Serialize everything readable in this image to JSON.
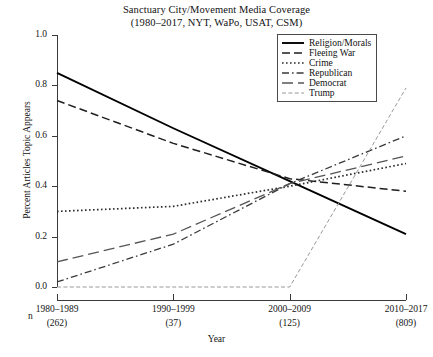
{
  "chart_data": {
    "type": "line",
    "title": "Sanctuary City/Movement Media Coverage",
    "subtitle": "(1980–2017, NYT, WaPo, USAT, CSM)",
    "xlabel": "Year",
    "ylabel": "Percent Articles Topic Appears",
    "ylim": [
      0.0,
      1.0
    ],
    "yticks": [
      "1.0",
      "0.8",
      "0.6",
      "0.4",
      "0.2",
      "0.0"
    ],
    "ytick_values": [
      1.0,
      0.8,
      0.6,
      0.4,
      0.2,
      0.0
    ],
    "categories": [
      "1980–1989",
      "1990–1999",
      "2000–2009",
      "2010–2017"
    ],
    "n_label": "n",
    "n_counts": [
      "(262)",
      "(37)",
      "(125)",
      "(809)"
    ],
    "grid": false,
    "legend_position": "top-right",
    "series": [
      {
        "name": "Religion/Morals",
        "style": "solid",
        "color": "#000000",
        "values": [
          0.85,
          0.63,
          0.42,
          0.21
        ]
      },
      {
        "name": "Fleeing War",
        "style": "dashed",
        "color": "#1f1f1f",
        "values": [
          0.74,
          0.57,
          0.43,
          0.38
        ]
      },
      {
        "name": "Crime",
        "style": "dotted",
        "color": "#2b2b2b",
        "values": [
          0.3,
          0.32,
          0.4,
          0.49
        ]
      },
      {
        "name": "Republican",
        "style": "dashdot",
        "color": "#3a3a3a",
        "values": [
          0.02,
          0.17,
          0.41,
          0.6
        ]
      },
      {
        "name": "Democrat",
        "style": "longdash",
        "color": "#555555",
        "values": [
          0.1,
          0.21,
          0.41,
          0.52
        ]
      },
      {
        "name": "Trump",
        "style": "finedash",
        "color": "#8c8c8c",
        "values": [
          0.0,
          0.0,
          0.0,
          0.79
        ]
      }
    ]
  }
}
